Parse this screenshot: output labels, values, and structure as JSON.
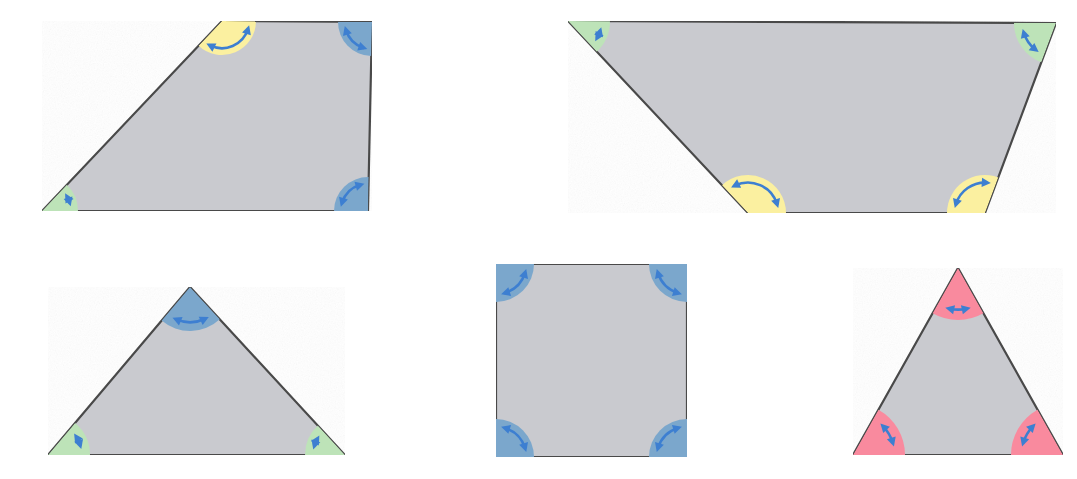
{
  "figure": {
    "background_color": "#ffffff",
    "body_fill": "#c9cacf",
    "body_stroke": "#4a4a4a",
    "marker_color": "#3d7fd1",
    "angle_colors": {
      "acute_green": "#bde3b8",
      "obtuse_yellow": "#fbf0a0",
      "right_blue": "#7ba7cc",
      "equal_pink": "#f98a9e"
    }
  },
  "shapes": [
    {
      "id": "shape-1",
      "name": "right-trapezoid",
      "sides": 4,
      "points": "222,21 372,22 368,211 42,211",
      "vertices": [
        {
          "label": "top-left",
          "x": 222,
          "y": 21,
          "angle_type": "obtuse",
          "color": "#fbf0a0",
          "radius": 34
        },
        {
          "label": "top-right",
          "x": 372,
          "y": 22,
          "angle_type": "right",
          "color": "#7ba7cc",
          "radius": 34
        },
        {
          "label": "bottom-right",
          "x": 368,
          "y": 211,
          "angle_type": "right",
          "color": "#7ba7cc",
          "radius": 34
        },
        {
          "label": "bottom-left",
          "x": 42,
          "y": 211,
          "angle_type": "acute",
          "color": "#bde3b8",
          "radius": 36
        }
      ]
    },
    {
      "id": "shape-2",
      "name": "inverted-isosceles-trapezoid",
      "sides": 4,
      "points": "568,21 1056,23 985,213 748,213",
      "vertices": [
        {
          "label": "top-left",
          "x": 568,
          "y": 21,
          "angle_type": "acute",
          "color": "#bde3b8",
          "radius": 42
        },
        {
          "label": "top-right",
          "x": 1056,
          "y": 23,
          "angle_type": "acute",
          "color": "#bde3b8",
          "radius": 42
        },
        {
          "label": "bottom-right",
          "x": 985,
          "y": 213,
          "angle_type": "obtuse",
          "color": "#fbf0a0",
          "radius": 38
        },
        {
          "label": "bottom-left",
          "x": 748,
          "y": 213,
          "angle_type": "obtuse",
          "color": "#fbf0a0",
          "radius": 38
        }
      ]
    },
    {
      "id": "shape-3",
      "name": "obtuse-isosceles-triangle",
      "sides": 3,
      "points": "190,287 345,455 48,455",
      "vertices": [
        {
          "label": "apex",
          "x": 190,
          "y": 287,
          "angle_type": "obtuse-blue",
          "color": "#7ba7cc",
          "radius": 44
        },
        {
          "label": "bottom-right",
          "x": 345,
          "y": 455,
          "angle_type": "acute",
          "color": "#bde3b8",
          "radius": 40
        },
        {
          "label": "bottom-left",
          "x": 48,
          "y": 455,
          "angle_type": "acute",
          "color": "#bde3b8",
          "radius": 42
        }
      ]
    },
    {
      "id": "shape-4",
      "name": "square",
      "sides": 4,
      "points": "496,264 687,264 687,457 496,457",
      "vertices": [
        {
          "label": "top-left",
          "x": 496,
          "y": 264,
          "angle_type": "right",
          "color": "#7ba7cc",
          "radius": 38
        },
        {
          "label": "top-right",
          "x": 687,
          "y": 264,
          "angle_type": "right",
          "color": "#7ba7cc",
          "radius": 38
        },
        {
          "label": "bottom-right",
          "x": 687,
          "y": 457,
          "angle_type": "right",
          "color": "#7ba7cc",
          "radius": 38
        },
        {
          "label": "bottom-left",
          "x": 496,
          "y": 457,
          "angle_type": "right",
          "color": "#7ba7cc",
          "radius": 38
        }
      ]
    },
    {
      "id": "shape-5",
      "name": "equilateral-triangle",
      "sides": 3,
      "points": "958,268 1063,455 853,455",
      "vertices": [
        {
          "label": "apex",
          "x": 958,
          "y": 268,
          "angle_type": "equal-60",
          "color": "#f98a9e",
          "radius": 52
        },
        {
          "label": "bottom-right",
          "x": 1063,
          "y": 455,
          "angle_type": "equal-60",
          "color": "#f98a9e",
          "radius": 52
        },
        {
          "label": "bottom-left",
          "x": 853,
          "y": 455,
          "angle_type": "equal-60",
          "color": "#f98a9e",
          "radius": 52
        }
      ]
    }
  ]
}
